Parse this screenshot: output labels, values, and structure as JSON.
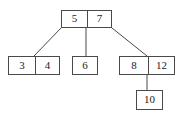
{
  "figure": {
    "type": "tree-diagram",
    "width": 182,
    "height": 117,
    "background_color": "#ffffff",
    "stroke_color": "#4a4a4a",
    "text_color": "#1c1c1c"
  },
  "tree": {
    "nodes": [
      {
        "id": "root",
        "keys": [
          "5",
          "7"
        ],
        "x": 61,
        "y": 10,
        "width": 51,
        "height": 18,
        "divider_x": 86
      },
      {
        "id": "leaf-left",
        "keys": [
          "3",
          "4"
        ],
        "x": 8,
        "y": 56,
        "width": 52,
        "height": 19,
        "divider_x": 34
      },
      {
        "id": "leaf-middle",
        "keys": [
          "6"
        ],
        "x": 72,
        "y": 56,
        "width": 26,
        "height": 19,
        "divider_x": null
      },
      {
        "id": "leaf-right",
        "keys": [
          "8",
          "12"
        ],
        "x": 119,
        "y": 56,
        "width": 56,
        "height": 19,
        "divider_x": 147
      },
      {
        "id": "leaf-bottom",
        "keys": [
          "10"
        ],
        "x": 136,
        "y": 90,
        "width": 27,
        "height": 20,
        "divider_x": null
      }
    ],
    "edges": [
      {
        "id": "edge-root-left",
        "from": "root",
        "to": "leaf-left",
        "x1": 61,
        "y1": 28,
        "x2": 34,
        "y2": 56
      },
      {
        "id": "edge-root-middle",
        "from": "root",
        "to": "leaf-middle",
        "x1": 86,
        "y1": 28,
        "x2": 86,
        "y2": 56
      },
      {
        "id": "edge-root-right",
        "from": "root",
        "to": "leaf-right",
        "x1": 112,
        "y1": 28,
        "x2": 147,
        "y2": 56
      },
      {
        "id": "edge-right-bottom",
        "from": "leaf-right",
        "to": "leaf-bottom",
        "x1": 147,
        "y1": 75,
        "x2": 147,
        "y2": 90
      }
    ]
  },
  "labels": {
    "root_key_1": "5",
    "root_key_2": "7",
    "left_key_1": "3",
    "left_key_2": "4",
    "middle_key_1": "6",
    "right_key_1": "8",
    "right_key_2": "12",
    "bottom_key_1": "10"
  }
}
